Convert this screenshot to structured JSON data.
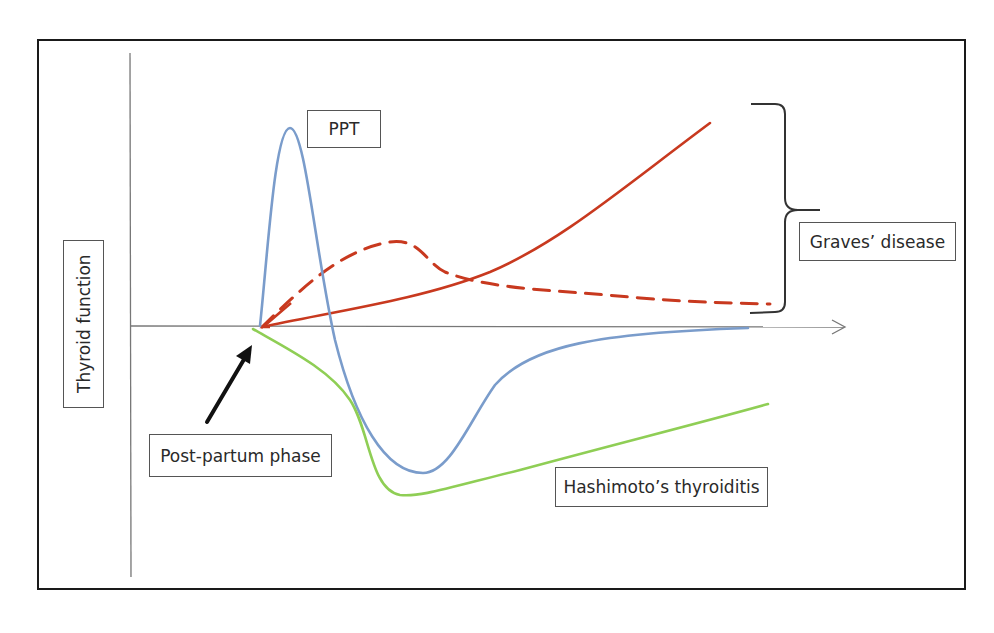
{
  "diagram": {
    "title": "",
    "y_axis_label": "Thyroid function",
    "labels": {
      "ppt": "PPT",
      "graves": "Graves’ disease",
      "postpartum": "Post-partum phase",
      "hashimoto": "Hashimoto’s thyroiditis"
    },
    "colors": {
      "ppt_curve": "#7a9ccb",
      "hashimoto_curve": "#8fce55",
      "graves_curve": "#c8391f",
      "axis": "#777777",
      "frame": "#1a1a1a"
    },
    "curves": [
      {
        "name": "PPT",
        "style": "solid",
        "color": "#7a9ccb",
        "description": "Sharp hyperthyroid peak after post-partum onset, followed by hypothyroid dip, then gradual return to baseline"
      },
      {
        "name": "Hashimoto's thyroiditis",
        "style": "solid",
        "color": "#8fce55",
        "description": "Falls below baseline into hypothyroidism then slowly rises but stays below baseline"
      },
      {
        "name": "Graves' disease (progressive)",
        "style": "solid",
        "color": "#c8391f",
        "description": "Steadily increasing thyroid function"
      },
      {
        "name": "Graves' disease (transient)",
        "style": "dashed",
        "color": "#c8391f",
        "description": "Moderate rise, plateau, then decline toward baseline"
      }
    ],
    "annotations": [
      {
        "type": "arrow",
        "target": "onset",
        "label": "Post-partum phase"
      },
      {
        "type": "brace",
        "spans": "Graves' curves",
        "label": "Graves’ disease"
      }
    ]
  },
  "caption": ""
}
